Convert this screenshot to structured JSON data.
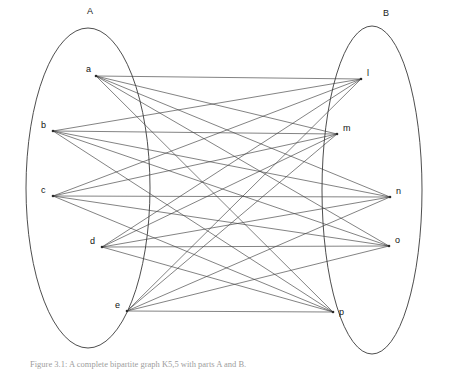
{
  "figure": {
    "type": "bipartite-graph",
    "width": 460,
    "height": 371,
    "background_color": "#ffffff",
    "line_color": "#3f3f3f",
    "label_color": "#111111"
  },
  "sets": [
    {
      "id": "A",
      "label": "A",
      "label_x": 90,
      "label_y": 14,
      "ellipse": {
        "cx": 88,
        "cy": 188,
        "rx": 62,
        "ry": 160
      }
    },
    {
      "id": "B",
      "label": "B",
      "label_x": 386,
      "label_y": 16,
      "ellipse": {
        "cx": 372,
        "cy": 190,
        "rx": 50,
        "ry": 164
      }
    }
  ],
  "nodes": [
    {
      "id": "a",
      "label": "a",
      "set": "A",
      "x": 96,
      "y": 76,
      "label_x": 86,
      "label_y": 72
    },
    {
      "id": "b",
      "label": "b",
      "set": "A",
      "x": 53,
      "y": 131,
      "label_x": 41,
      "label_y": 128
    },
    {
      "id": "c",
      "label": "c",
      "set": "A",
      "x": 53,
      "y": 196,
      "label_x": 41,
      "label_y": 193
    },
    {
      "id": "d",
      "label": "d",
      "set": "A",
      "x": 102,
      "y": 247,
      "label_x": 90,
      "label_y": 244
    },
    {
      "id": "e",
      "label": "e",
      "set": "A",
      "x": 127,
      "y": 311,
      "label_x": 115,
      "label_y": 308
    },
    {
      "id": "l",
      "label": "l",
      "set": "B",
      "x": 361,
      "y": 79,
      "label_x": 367,
      "label_y": 76
    },
    {
      "id": "m",
      "label": "m",
      "set": "B",
      "x": 337,
      "y": 134,
      "label_x": 343,
      "label_y": 131
    },
    {
      "id": "n",
      "label": "n",
      "set": "B",
      "x": 390,
      "y": 197,
      "label_x": 396,
      "label_y": 194
    },
    {
      "id": "o",
      "label": "o",
      "set": "B",
      "x": 389,
      "y": 246,
      "label_x": 395,
      "label_y": 243
    },
    {
      "id": "p",
      "label": "p",
      "set": "B",
      "x": 333,
      "y": 312,
      "label_x": 339,
      "label_y": 315
    }
  ],
  "edges": [
    [
      "a",
      "l"
    ],
    [
      "a",
      "m"
    ],
    [
      "a",
      "n"
    ],
    [
      "a",
      "o"
    ],
    [
      "a",
      "p"
    ],
    [
      "b",
      "l"
    ],
    [
      "b",
      "m"
    ],
    [
      "b",
      "n"
    ],
    [
      "b",
      "o"
    ],
    [
      "b",
      "p"
    ],
    [
      "c",
      "l"
    ],
    [
      "c",
      "m"
    ],
    [
      "c",
      "n"
    ],
    [
      "c",
      "o"
    ],
    [
      "c",
      "p"
    ],
    [
      "d",
      "l"
    ],
    [
      "d",
      "m"
    ],
    [
      "d",
      "n"
    ],
    [
      "d",
      "o"
    ],
    [
      "d",
      "p"
    ],
    [
      "e",
      "l"
    ],
    [
      "e",
      "m"
    ],
    [
      "e",
      "n"
    ],
    [
      "e",
      "o"
    ],
    [
      "e",
      "p"
    ]
  ],
  "caption": {
    "text": "Figure 3.1: A complete bipartite graph K5,5 with parts A and B."
  }
}
